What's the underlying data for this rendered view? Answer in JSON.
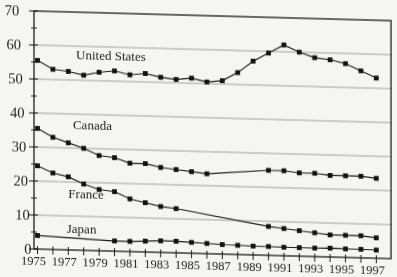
{
  "chart_data": {
    "type": "line",
    "title": "",
    "xlabel": "",
    "ylabel": "",
    "x": [
      1975,
      1976,
      1977,
      1978,
      1979,
      1980,
      1981,
      1982,
      1983,
      1984,
      1985,
      1986,
      1987,
      1988,
      1989,
      1990,
      1991,
      1992,
      1993,
      1994,
      1995,
      1996,
      1997
    ],
    "x_tick_labels": [
      "1975",
      "1977",
      "1979",
      "1981",
      "1983",
      "1985",
      "1987",
      "1989",
      "1991",
      "1993",
      "1995",
      "1997"
    ],
    "y_tick_labels": [
      "70",
      "60",
      "50",
      "40",
      "30",
      "20",
      "10",
      "0"
    ],
    "ylim": [
      0,
      70
    ],
    "y_major_step": 10,
    "y_minor_step": 5,
    "grid": "horizontal",
    "legend": "none-inline-series-labels",
    "marker": "filled-square",
    "series": [
      {
        "name": "United States",
        "label": {
          "text": "United States",
          "x": 1977.5,
          "y": 57.5
        },
        "values": [
          55.5,
          53,
          52.5,
          51.5,
          52.5,
          53,
          52,
          52.5,
          51.5,
          51,
          51.5,
          50.5,
          51,
          53.5,
          57,
          59.5,
          62,
          60,
          58.5,
          58,
          57,
          55,
          53
        ]
      },
      {
        "name": "Canada",
        "label": {
          "text": "Canada",
          "x": 1977.3,
          "y": 37
        },
        "values": [
          35.5,
          33,
          31.5,
          30,
          28,
          27.5,
          26,
          26,
          25,
          24.5,
          24,
          23.5,
          null,
          null,
          null,
          25,
          25,
          24.5,
          24.5,
          24,
          24,
          24,
          23.5
        ]
      },
      {
        "name": "France",
        "label": {
          "text": "France",
          "x": 1977.0,
          "y": 16.5
        },
        "values": [
          24.5,
          22.5,
          21.5,
          19.5,
          18,
          17.5,
          15.5,
          14.5,
          13.5,
          13,
          null,
          null,
          null,
          null,
          null,
          8.5,
          8,
          7.5,
          7,
          6.5,
          6.5,
          6.5,
          6
        ]
      },
      {
        "name": "Japan",
        "label": {
          "text": "Japan",
          "x": 1976.9,
          "y": 6.3
        },
        "values": [
          4,
          null,
          null,
          null,
          null,
          3,
          3,
          3.2,
          3.4,
          3.4,
          3.2,
          3,
          2.8,
          2.7,
          2.6,
          2.6,
          2.5,
          2.5,
          2.5,
          2.6,
          2.5,
          2.5,
          2.4
        ]
      }
    ],
    "colors": {
      "ink": "#1d1c1a",
      "grid": "#8f8d87",
      "paper": "#f6f5f1"
    }
  }
}
